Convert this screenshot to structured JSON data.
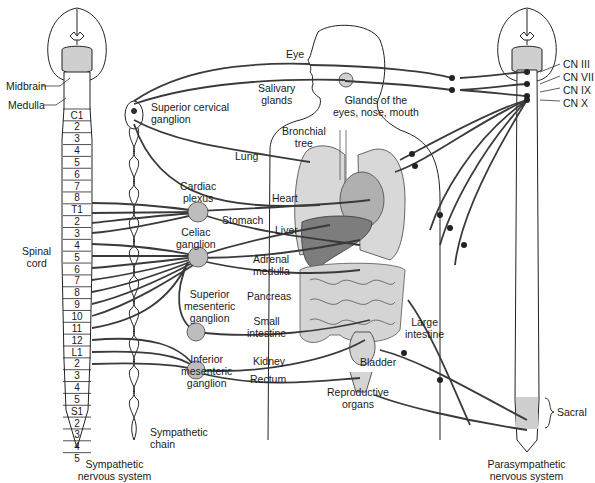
{
  "diagram": {
    "title_left": "Sympathetic nervous system",
    "title_right": "Parasympathetic nervous system",
    "colors": {
      "organ_light": "#d4d4d4",
      "organ_dark": "#8a8a8a",
      "ganglion": "#bdbdbd",
      "nerve": "#3a3a3a",
      "sacral": "#cfcfcf"
    },
    "brain_labels": {
      "midbrain": "Midbrain",
      "medulla": "Medulla"
    },
    "spinal_cord_label": [
      "Spinal",
      "cord"
    ],
    "spinal_segments": [
      "C1",
      "2",
      "3",
      "4",
      "5",
      "6",
      "7",
      "8",
      "T1",
      "2",
      "3",
      "4",
      "5",
      "6",
      "7",
      "8",
      "9",
      "10",
      "11",
      "12",
      "L1",
      "2",
      "3",
      "4",
      "5",
      "S1",
      "2",
      "3",
      "4",
      "5"
    ],
    "sympathetic_chain_label": [
      "Sympathetic",
      "chain"
    ],
    "ganglia": {
      "superior_cervical": [
        "Superior cervical",
        "ganglion"
      ],
      "cardiac_plexus": [
        "Cardiac",
        "plexus"
      ],
      "celiac": [
        "Celiac",
        "ganglion"
      ],
      "superior_mesenteric": [
        "Superior",
        "mesenteric",
        "ganglion"
      ],
      "inferior_mesenteric": [
        "Inferior",
        "mesenteric",
        "ganglion"
      ]
    },
    "organs": {
      "eye": "Eye",
      "salivary": [
        "Salivary",
        "glands"
      ],
      "glands_eyes": [
        "Glands of the",
        "eyes, nose, mouth"
      ],
      "bronchial": [
        "Bronchial",
        "tree"
      ],
      "lung": "Lung",
      "heart": "Heart",
      "stomach": "Stomach",
      "liver": "Liver",
      "adrenal": [
        "Adrenal",
        "medulla"
      ],
      "pancreas": "Pancreas",
      "small_intestine": [
        "Small",
        "intestine"
      ],
      "kidney": "Kidney",
      "rectum": "Rectum",
      "large_intestine": [
        "Large",
        "intestine"
      ],
      "bladder": "Bladder",
      "reproductive": [
        "Reproductive",
        "organs"
      ]
    },
    "cranial_nerves": [
      "CN III",
      "CN VII",
      "CN IX",
      "CN X"
    ],
    "sacral_label": "Sacral"
  }
}
